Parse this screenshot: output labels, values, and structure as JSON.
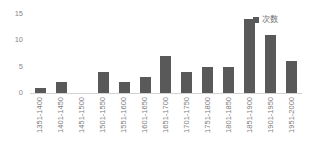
{
  "chart_data": {
    "type": "bar",
    "title": "",
    "xlabel": "",
    "ylabel": "",
    "ylim": [
      0,
      15
    ],
    "yticks": [
      0,
      5,
      10,
      15
    ],
    "grid": false,
    "legend_position": "top-right",
    "series": [
      {
        "name": "次数",
        "color": "#595959",
        "values": [
          1,
          2,
          0,
          4,
          2,
          3,
          7,
          4,
          5,
          5,
          14,
          11,
          6
        ]
      }
    ],
    "categories": [
      "1351-1400",
      "1401-1450",
      "1451-1500",
      "1501-1550",
      "1551-1600",
      "1601-1650",
      "1651-1700",
      "1701-1750",
      "1751-1800",
      "1801-1850",
      "1851-1900",
      "1901-1950",
      "1951-2000"
    ]
  },
  "legend": {
    "label": "次数",
    "swatch_color": "#595959"
  },
  "axis": {
    "y_ticks": [
      "0",
      "5",
      "10",
      "15"
    ],
    "baseline_color": "#d2d2d2"
  }
}
